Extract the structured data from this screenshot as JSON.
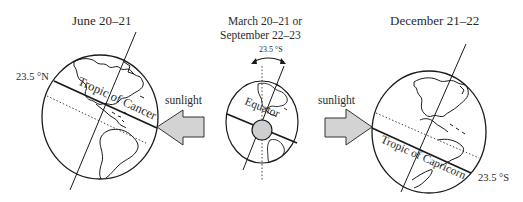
{
  "panels": {
    "june": {
      "title": "June 20–21",
      "latitude_label": "23.5 °N",
      "tropic_label": "Tropic of Cancer"
    },
    "equinox": {
      "title_line1": "March 20–21 or",
      "title_line2": "September 22–23",
      "tilt_label": "23.5 °S",
      "equator_label": "Equator"
    },
    "december": {
      "title": "December 21–22",
      "latitude_label": "23.5 °S",
      "tropic_label": "Tropic of Capricorn"
    }
  },
  "arrows": {
    "left": {
      "label": "sunlight",
      "direction": "left"
    },
    "right": {
      "label": "sunlight",
      "direction": "right"
    }
  },
  "colors": {
    "arrow_fill": "#d3d3d3",
    "sun_disc_fill": "#cfcfcf",
    "stroke": "#1a1a1a"
  }
}
